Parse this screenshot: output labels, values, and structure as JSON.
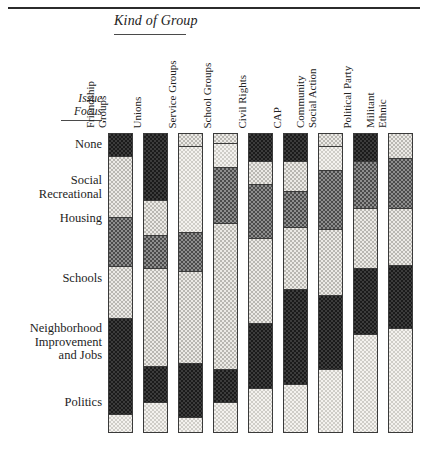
{
  "figure": {
    "column_group_title": "Kind of Group",
    "row_group_title_line1": "Issue",
    "row_group_title_line2": "Focus"
  },
  "columns": [
    {
      "id": "friendship-groups",
      "line1": "Friendship",
      "line2": "Groups",
      "x": 108
    },
    {
      "id": "unions",
      "line1": "Unions",
      "line2": "",
      "x": 143
    },
    {
      "id": "service-groups",
      "line1": "Service Groups",
      "line2": "",
      "x": 178
    },
    {
      "id": "school-groups",
      "line1": "School Groups",
      "line2": "",
      "x": 213
    },
    {
      "id": "civil-rights",
      "line1": "Civil Rights",
      "line2": "",
      "x": 248
    },
    {
      "id": "cap",
      "line1": "CAP",
      "line2": "",
      "x": 283
    },
    {
      "id": "community-social-action",
      "line1": "Community",
      "line2": "Social Action",
      "x": 318
    },
    {
      "id": "political-party",
      "line1": "Political Party",
      "line2": "",
      "x": 353
    },
    {
      "id": "militant-ethnic",
      "line1": "Militant",
      "line2": "Ethnic",
      "x": 388
    }
  ],
  "rows": [
    {
      "id": "none",
      "label": "None",
      "y": 138
    },
    {
      "id": "social-recreational",
      "label": "Social\nRecreational",
      "y": 174
    },
    {
      "id": "housing",
      "label": "Housing",
      "y": 212
    },
    {
      "id": "schools",
      "label": "Schools",
      "y": 272
    },
    {
      "id": "neighborhood-improvement-and-jobs",
      "label": "Neighborhood\nImprovement\nand Jobs",
      "y": 322
    },
    {
      "id": "politics",
      "label": "Politics",
      "y": 396
    }
  ],
  "chart_data": {
    "type": "bar",
    "title": "Kind of Group",
    "xlabel": "Kind of Group",
    "ylabel": "Issue Focus",
    "orientation": "vertical-stacked",
    "units": "percent",
    "ylim": [
      0,
      100
    ],
    "grid": false,
    "legend": "none",
    "categories": [
      "Friendship Groups",
      "Unions",
      "Service Groups",
      "School Groups",
      "Civil Rights",
      "CAP",
      "Community Social Action",
      "Political Party",
      "Militant Ethnic"
    ],
    "stack_order_top_to_bottom": [
      "None",
      "Social Recreational",
      "Housing",
      "Schools",
      "Neighborhood Improvement and Jobs",
      "Politics"
    ],
    "series": [
      {
        "name": "None",
        "values": [
          8,
          22,
          4,
          3,
          9,
          9,
          4,
          9,
          0
        ]
      },
      {
        "name": "Social Recreational",
        "values": [
          21,
          12,
          29,
          8,
          8,
          10,
          8,
          0,
          8
        ]
      },
      {
        "name": "Housing",
        "values": [
          16,
          11,
          13,
          19,
          18,
          12,
          20,
          16,
          17
        ]
      },
      {
        "name": "Schools",
        "values": [
          17,
          33,
          31,
          49,
          29,
          21,
          22,
          20,
          19
        ]
      },
      {
        "name": "Neighborhood Improvement and Jobs",
        "values": [
          32,
          12,
          18,
          11,
          22,
          32,
          25,
          22,
          21
        ]
      },
      {
        "name": "Politics",
        "values": [
          6,
          10,
          5,
          10,
          14,
          16,
          21,
          33,
          35
        ]
      }
    ],
    "shades": {
      "None": "dark",
      "Social Recreational": "light",
      "Housing": "medium",
      "Schools": "light",
      "Neighborhood Improvement and Jobs": "dark",
      "Politics": "pale"
    },
    "columns_segments": [
      {
        "category": "Friendship Groups",
        "segments": [
          {
            "row": "None",
            "shade": "dark",
            "height_px": 22
          },
          {
            "row": "Social Recreational",
            "shade": "light",
            "height_px": 62
          },
          {
            "row": "Housing",
            "shade": "medium",
            "height_px": 49
          },
          {
            "row": "Schools",
            "shade": "light",
            "height_px": 52
          },
          {
            "row": "Neighborhood Improvement and Jobs",
            "shade": "dark",
            "height_px": 97
          },
          {
            "row": "Politics",
            "shade": "pale",
            "height_px": 18
          }
        ]
      },
      {
        "category": "Unions",
        "segments": [
          {
            "row": "None",
            "shade": "dark",
            "height_px": 66
          },
          {
            "row": "Social Recreational",
            "shade": "light",
            "height_px": 36
          },
          {
            "row": "Housing",
            "shade": "medium",
            "height_px": 33
          },
          {
            "row": "Schools",
            "shade": "light",
            "height_px": 99
          },
          {
            "row": "Neighborhood Improvement and Jobs",
            "shade": "dark",
            "height_px": 36
          },
          {
            "row": "Politics",
            "shade": "pale",
            "height_px": 30
          }
        ]
      },
      {
        "category": "Service Groups",
        "segments": [
          {
            "row": "None",
            "shade": "light",
            "height_px": 12
          },
          {
            "row": "Social Recreational",
            "shade": "pale",
            "height_px": 87
          },
          {
            "row": "Housing",
            "shade": "medium",
            "height_px": 39
          },
          {
            "row": "Schools",
            "shade": "light",
            "height_px": 93
          },
          {
            "row": "Neighborhood Improvement and Jobs",
            "shade": "dark",
            "height_px": 54
          },
          {
            "row": "Politics",
            "shade": "pale",
            "height_px": 15
          }
        ]
      },
      {
        "category": "School Groups",
        "segments": [
          {
            "row": "None",
            "shade": "light",
            "height_px": 9
          },
          {
            "row": "Social Recreational",
            "shade": "pale",
            "height_px": 24
          },
          {
            "row": "Housing",
            "shade": "medium",
            "height_px": 57
          },
          {
            "row": "Schools",
            "shade": "light",
            "height_px": 147
          },
          {
            "row": "Neighborhood Improvement and Jobs",
            "shade": "dark",
            "height_px": 33
          },
          {
            "row": "Politics",
            "shade": "pale",
            "height_px": 30
          }
        ]
      },
      {
        "category": "Civil Rights",
        "segments": [
          {
            "row": "None",
            "shade": "dark",
            "height_px": 27
          },
          {
            "row": "Social Recreational",
            "shade": "light",
            "height_px": 23
          },
          {
            "row": "Housing",
            "shade": "medium",
            "height_px": 55
          },
          {
            "row": "Schools",
            "shade": "light",
            "height_px": 85
          },
          {
            "row": "Neighborhood Improvement and Jobs",
            "shade": "dark",
            "height_px": 66
          },
          {
            "row": "Politics",
            "shade": "pale",
            "height_px": 44
          }
        ]
      },
      {
        "category": "CAP",
        "segments": [
          {
            "row": "None",
            "shade": "dark",
            "height_px": 27
          },
          {
            "row": "Social Recreational",
            "shade": "light",
            "height_px": 30
          },
          {
            "row": "Housing",
            "shade": "medium",
            "height_px": 37
          },
          {
            "row": "Schools",
            "shade": "light",
            "height_px": 62
          },
          {
            "row": "Neighborhood Improvement and Jobs",
            "shade": "dark",
            "height_px": 96
          },
          {
            "row": "Politics",
            "shade": "pale",
            "height_px": 48
          }
        ]
      },
      {
        "category": "Community Social Action",
        "segments": [
          {
            "row": "None",
            "shade": "light",
            "height_px": 12
          },
          {
            "row": "Social Recreational",
            "shade": "pale",
            "height_px": 24
          },
          {
            "row": "Housing",
            "shade": "medium",
            "height_px": 60
          },
          {
            "row": "Schools",
            "shade": "light",
            "height_px": 66
          },
          {
            "row": "Neighborhood Improvement and Jobs",
            "shade": "dark",
            "height_px": 75
          },
          {
            "row": "Politics",
            "shade": "pale",
            "height_px": 63
          }
        ]
      },
      {
        "category": "Political Party",
        "segments": [
          {
            "row": "None",
            "shade": "dark",
            "height_px": 27
          },
          {
            "row": "Housing",
            "shade": "medium",
            "height_px": 48
          },
          {
            "row": "Schools",
            "shade": "light",
            "height_px": 60
          },
          {
            "row": "Neighborhood Improvement and Jobs",
            "shade": "dark",
            "height_px": 66
          },
          {
            "row": "Politics",
            "shade": "pale",
            "height_px": 99
          }
        ]
      },
      {
        "category": "Militant Ethnic",
        "segments": [
          {
            "row": "Social Recreational",
            "shade": "light",
            "height_px": 24
          },
          {
            "row": "Housing",
            "shade": "medium",
            "height_px": 51
          },
          {
            "row": "Schools",
            "shade": "light",
            "height_px": 57
          },
          {
            "row": "Neighborhood Improvement and Jobs",
            "shade": "dark",
            "height_px": 63
          },
          {
            "row": "Politics",
            "shade": "pale",
            "height_px": 105
          }
        ]
      }
    ]
  }
}
